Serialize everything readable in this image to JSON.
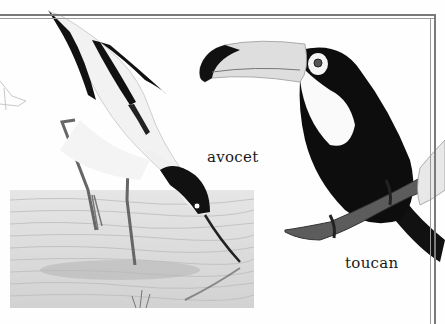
{
  "page": {
    "captions": {
      "avocet": "avocet",
      "toucan": "toucan"
    },
    "illustrations": [
      {
        "name": "avocet",
        "description": "Black-and-white wading bird bending down with upturned bill into shallow water"
      },
      {
        "name": "toucan",
        "description": "Toucan with large pale bill perched on a branch"
      },
      {
        "name": "water",
        "description": "Shallow water panel under the avocet"
      },
      {
        "name": "partial-bird-sketch",
        "description": "Faint sketch at left edge"
      },
      {
        "name": "partial-bird-right",
        "description": "Partial bird wing at right edge"
      }
    ],
    "colors": {
      "frame": "#7a7a7a",
      "background": "#fefefe",
      "ink": "#1a1a1a",
      "water": "#dcdcdc"
    }
  }
}
